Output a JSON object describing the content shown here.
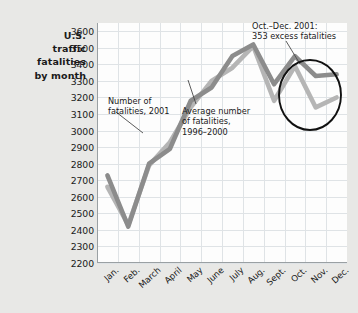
{
  "chart_data": {
    "type": "line",
    "title": "U.S. traffic fatalities by month",
    "title_lines": [
      "U.S.",
      "traffic",
      "fatalities",
      "by month"
    ],
    "xlabel": "",
    "ylabel": "",
    "categories": [
      "Jan.",
      "Feb.",
      "March",
      "April",
      "May",
      "June",
      "July",
      "Aug.",
      "Sept.",
      "Oct.",
      "Nov.",
      "Dec."
    ],
    "ylim": [
      2200,
      3650
    ],
    "yticks": [
      3600,
      3500,
      3400,
      3300,
      3200,
      3100,
      3000,
      2900,
      2800,
      2700,
      2600,
      2500,
      2400,
      2300,
      2200
    ],
    "grid": true,
    "legend": "none",
    "series": [
      {
        "name": "Number of fatalities, 2001",
        "color": "#8c8c8c",
        "values": [
          2730,
          2420,
          2800,
          2890,
          3180,
          3260,
          3450,
          3520,
          3280,
          3450,
          3330,
          3340
        ]
      },
      {
        "name": "Average number of fatalities, 1996–2000",
        "color": "#b5b5b5",
        "values": [
          2660,
          2430,
          2790,
          2930,
          3140,
          3300,
          3380,
          3510,
          3180,
          3390,
          3140,
          3200
        ]
      }
    ],
    "annotations": [
      {
        "id": "series-2001",
        "text_lines": [
          "Number of",
          "fatalities, 2001"
        ]
      },
      {
        "id": "series-average",
        "text_lines": [
          "Average number",
          "of fatalities,",
          "1996–2000"
        ]
      },
      {
        "id": "excess-callout",
        "text_lines": [
          "Oct.–Dec. 2001:",
          "353 excess fatalities"
        ],
        "highlight_shape": "ellipse",
        "highlight_months": [
          "Oct.",
          "Nov.",
          "Dec."
        ],
        "excess_fatalities": 353
      }
    ]
  }
}
